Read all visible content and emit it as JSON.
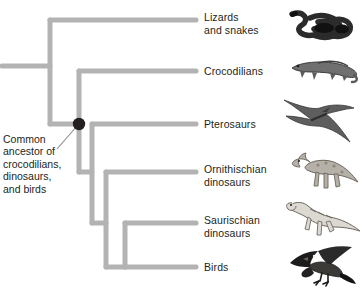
{
  "figure": {
    "type": "cladogram",
    "title": "",
    "annotation": {
      "text": "Common\nancestor of\ncrocodilians,\ndinosaurs,\nand birds",
      "points_to_node": "crocodilian-dinosaur-bird-ancestor"
    },
    "colors": {
      "branch": "#b3b3b3",
      "node_marker": "#231f20",
      "text": "#231f20",
      "leader_line": "#808080",
      "background": "#ffffff"
    },
    "branch_width_px": 5,
    "taxa": [
      {
        "id": "lizards-and-snakes",
        "label": "Lizards\nand snakes",
        "tip_y": 20,
        "icon": "snake-illustration"
      },
      {
        "id": "crocodilians",
        "label": "Crocodilians",
        "tip_y": 71,
        "icon": "crocodile-illustration"
      },
      {
        "id": "pterosaurs",
        "label": "Pterosaurs",
        "tip_y": 124,
        "icon": "pterosaur-illustration"
      },
      {
        "id": "ornithischian-dinosaurs",
        "label": "Ornithischian\ndinosaurs",
        "tip_y": 172,
        "icon": "hadrosaur-illustration"
      },
      {
        "id": "saurischian-dinosaurs",
        "label": "Saurischian\ndinosaurs",
        "tip_y": 223,
        "icon": "theropod-illustration"
      },
      {
        "id": "birds",
        "label": "Birds",
        "tip_y": 267,
        "icon": "bird-illustration"
      }
    ],
    "nodes": [
      {
        "id": "root",
        "x": 50,
        "y": 66,
        "marker": false
      },
      {
        "id": "crocodilian-dinosaur-bird-ancestor",
        "x": 79,
        "y": 124,
        "marker": true
      },
      {
        "id": "dinosaur-bird-ancestor",
        "x": 92,
        "y": 172,
        "marker": false
      },
      {
        "id": "ornithischian-saurischian-ancestor",
        "x": 106,
        "y": 223,
        "marker": false
      },
      {
        "id": "saurischian-bird-ancestor",
        "x": 125,
        "y": 267,
        "marker": false
      }
    ],
    "tip_line_end_x": 196,
    "label_x": 204,
    "icon_x": 286
  }
}
